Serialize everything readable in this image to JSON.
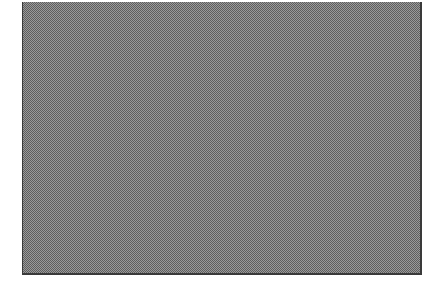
{
  "canvas": {
    "background": "#ffffff",
    "panel_fill": "#9a9a9a",
    "panel_pattern_dark": "#5e5e5e",
    "panel_border": "#3a3a3a"
  }
}
